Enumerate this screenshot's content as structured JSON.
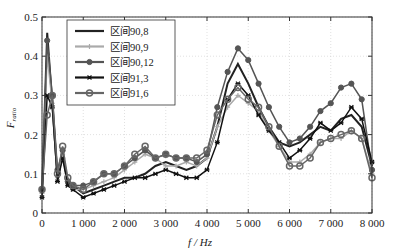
{
  "chart_data": {
    "type": "line",
    "title": "",
    "xlabel": "f / Hz",
    "ylabel": "F_ratio",
    "xlim": [
      0,
      8000
    ],
    "ylim": [
      0,
      0.5
    ],
    "xticks": [
      0,
      1000,
      2000,
      3000,
      4000,
      5000,
      6000,
      7000,
      8000
    ],
    "xtick_labels": [
      "0",
      "1 000",
      "2 000",
      "3 000",
      "4 000",
      "5 000",
      "6 000",
      "7 000",
      "8 000"
    ],
    "yticks": [
      0,
      0.1,
      0.2,
      0.3,
      0.4,
      0.5
    ],
    "ytick_labels": [
      "0",
      "0.1",
      "0.2",
      "0.3",
      "0.4",
      "0.5"
    ],
    "grid": true,
    "legend_position": "upper-left",
    "x": [
      0,
      125,
      250,
      375,
      500,
      625,
      750,
      1000,
      1250,
      1500,
      1750,
      2000,
      2250,
      2500,
      2750,
      3000,
      3250,
      3500,
      3750,
      4000,
      4250,
      4500,
      4750,
      5000,
      5250,
      5500,
      5750,
      6000,
      6250,
      6500,
      6750,
      7000,
      7250,
      7500,
      7750,
      8000
    ],
    "series": [
      {
        "name": "区间90,8",
        "color": "#222222",
        "marker": "none",
        "values": [
          0.05,
          0.46,
          0.28,
          0.09,
          0.15,
          0.08,
          0.07,
          0.05,
          0.06,
          0.07,
          0.08,
          0.09,
          0.09,
          0.1,
          0.12,
          0.13,
          0.12,
          0.11,
          0.12,
          0.14,
          0.22,
          0.33,
          0.38,
          0.33,
          0.27,
          0.22,
          0.18,
          0.17,
          0.18,
          0.2,
          0.22,
          0.21,
          0.24,
          0.25,
          0.22,
          0.12
        ]
      },
      {
        "name": "区间90,9",
        "color": "#aaaaaa",
        "marker": "plus",
        "values": [
          0.05,
          0.4,
          0.28,
          0.09,
          0.15,
          0.08,
          0.06,
          0.06,
          0.07,
          0.08,
          0.09,
          0.11,
          0.13,
          0.15,
          0.14,
          0.12,
          0.12,
          0.13,
          0.12,
          0.14,
          0.22,
          0.27,
          0.3,
          0.28,
          0.26,
          0.21,
          0.17,
          0.13,
          0.13,
          0.15,
          0.18,
          0.19,
          0.19,
          0.21,
          0.19,
          0.1
        ]
      },
      {
        "name": "区间90,12",
        "color": "#555555",
        "marker": "dot",
        "values": [
          0.06,
          0.44,
          0.3,
          0.11,
          0.16,
          0.08,
          0.07,
          0.07,
          0.08,
          0.1,
          0.1,
          0.12,
          0.14,
          0.16,
          0.14,
          0.15,
          0.14,
          0.14,
          0.13,
          0.15,
          0.27,
          0.36,
          0.42,
          0.39,
          0.33,
          0.27,
          0.22,
          0.18,
          0.19,
          0.22,
          0.26,
          0.28,
          0.32,
          0.33,
          0.29,
          0.11
        ]
      },
      {
        "name": "区间91,3",
        "color": "#111111",
        "marker": "star",
        "values": [
          0.04,
          0.3,
          0.27,
          0.08,
          0.14,
          0.07,
          0.06,
          0.04,
          0.05,
          0.06,
          0.07,
          0.08,
          0.09,
          0.09,
          0.1,
          0.11,
          0.1,
          0.09,
          0.09,
          0.11,
          0.18,
          0.29,
          0.33,
          0.3,
          0.25,
          0.21,
          0.18,
          0.14,
          0.16,
          0.19,
          0.23,
          0.21,
          0.23,
          0.27,
          0.24,
          0.13
        ]
      },
      {
        "name": "区间91,6",
        "color": "#666666",
        "marker": "circle",
        "values": [
          0.06,
          0.25,
          0.3,
          0.1,
          0.17,
          0.09,
          0.07,
          0.06,
          0.08,
          0.1,
          0.1,
          0.12,
          0.15,
          0.17,
          0.14,
          0.15,
          0.14,
          0.14,
          0.14,
          0.16,
          0.25,
          0.29,
          0.32,
          0.29,
          0.27,
          0.22,
          0.17,
          0.12,
          0.12,
          0.14,
          0.18,
          0.19,
          0.2,
          0.21,
          0.19,
          0.09
        ]
      }
    ]
  }
}
